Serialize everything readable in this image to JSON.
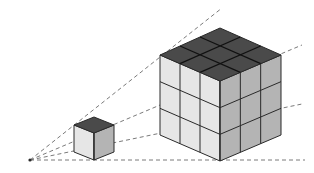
{
  "diagram": {
    "origin": {
      "x": 30,
      "y": 160
    },
    "colors": {
      "background": "#ffffff",
      "top_face": "#4a4a4a",
      "left_face": "#e6e6e6",
      "right_face": "#b4b4b4",
      "edge": "#2a2a2a",
      "ray": "#7a7a7a"
    },
    "rays": [
      {
        "name": "ray-top",
        "x2": 222,
        "y2": 8
      },
      {
        "name": "ray-upper",
        "x2": 302,
        "y2": 45
      },
      {
        "name": "ray-lower",
        "x2": 302,
        "y2": 104
      },
      {
        "name": "ray-base",
        "x2": 305,
        "y2": 160
      }
    ],
    "small_cube": {
      "grid": 1,
      "top": [
        [
          74,
          125
        ],
        [
          94,
          117
        ],
        [
          114,
          125
        ],
        [
          94,
          133
        ]
      ],
      "height": 27
    },
    "large_cube": {
      "grid": 3,
      "top": [
        [
          160,
          55
        ],
        [
          220,
          28
        ],
        [
          281,
          55
        ],
        [
          220,
          81
        ]
      ],
      "height": 80
    }
  }
}
